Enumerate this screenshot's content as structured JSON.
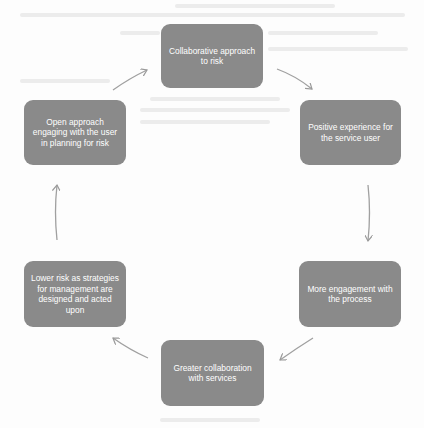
{
  "diagram": {
    "type": "cycle",
    "box_color": "#8a8a8a",
    "text_color": "#ffffff",
    "arrow_color": "#9a9a9a",
    "nodes": [
      {
        "id": "n1",
        "label": "Collaborative approach to risk"
      },
      {
        "id": "n2",
        "label": "Positive experience for the service user"
      },
      {
        "id": "n3",
        "label": "More engagement with the process"
      },
      {
        "id": "n4",
        "label": "Greater collaboration with services"
      },
      {
        "id": "n5",
        "label": "Lower risk as strategies for management are designed and acted upon"
      },
      {
        "id": "n6",
        "label": "Open approach engaging with the user in planning for risk"
      }
    ],
    "edges": [
      {
        "from": "n1",
        "to": "n2"
      },
      {
        "from": "n2",
        "to": "n3"
      },
      {
        "from": "n3",
        "to": "n4"
      },
      {
        "from": "n4",
        "to": "n5"
      },
      {
        "from": "n5",
        "to": "n6"
      },
      {
        "from": "n6",
        "to": "n1"
      }
    ]
  }
}
